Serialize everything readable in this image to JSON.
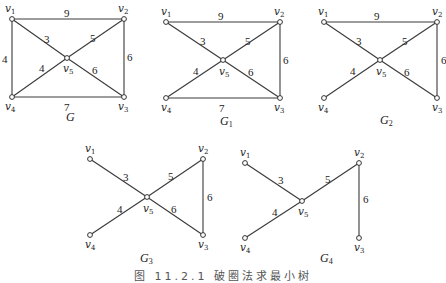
{
  "figure": {
    "caption": "图 11.2.1  破圈法求最小树",
    "colors": {
      "edge": "#3a3a3a",
      "node_fill": "#ffffff",
      "text": "#222222"
    },
    "graphs": [
      {
        "id": "G",
        "name": "G",
        "sub": "",
        "label_pos": [
          66,
          121
        ],
        "nodes": [
          {
            "id": "v1",
            "sub": "1",
            "x": 12,
            "y": 19,
            "lx": 5,
            "ly": 12
          },
          {
            "id": "v2",
            "sub": "2",
            "x": 124,
            "y": 19,
            "lx": 118,
            "ly": 12
          },
          {
            "id": "v3",
            "sub": "3",
            "x": 124,
            "y": 97,
            "lx": 118,
            "ly": 110
          },
          {
            "id": "v4",
            "sub": "4",
            "x": 12,
            "y": 97,
            "lx": 5,
            "ly": 110
          },
          {
            "id": "v5",
            "sub": "5",
            "x": 67,
            "y": 58,
            "lx": 63,
            "ly": 72
          }
        ],
        "edges": [
          {
            "from": "v1",
            "to": "v2",
            "w": "9",
            "lx": 64,
            "ly": 17
          },
          {
            "from": "v1",
            "to": "v5",
            "w": "3",
            "lx": 44,
            "ly": 43
          },
          {
            "from": "v2",
            "to": "v5",
            "w": "5",
            "lx": 90,
            "ly": 42
          },
          {
            "from": "v2",
            "to": "v3",
            "w": "6",
            "lx": 127,
            "ly": 61
          },
          {
            "from": "v1",
            "to": "v4",
            "w": "4",
            "lx": 2,
            "ly": 63
          },
          {
            "from": "v4",
            "to": "v5",
            "w": "4",
            "lx": 39,
            "ly": 72
          },
          {
            "from": "v5",
            "to": "v3",
            "w": "6",
            "lx": 92,
            "ly": 74
          },
          {
            "from": "v4",
            "to": "v3",
            "w": "7",
            "lx": 64,
            "ly": 111
          }
        ]
      },
      {
        "id": "G1",
        "name": "G",
        "sub": "1",
        "label_pos": [
          220,
          125
        ],
        "nodes": [
          {
            "id": "v1",
            "sub": "1",
            "x": 166,
            "y": 22,
            "lx": 161,
            "ly": 15
          },
          {
            "id": "v2",
            "sub": "2",
            "x": 280,
            "y": 22,
            "lx": 274,
            "ly": 15
          },
          {
            "id": "v3",
            "sub": "3",
            "x": 280,
            "y": 98,
            "lx": 274,
            "ly": 111
          },
          {
            "id": "v4",
            "sub": "4",
            "x": 166,
            "y": 98,
            "lx": 161,
            "ly": 111
          },
          {
            "id": "v5",
            "sub": "5",
            "x": 223,
            "y": 60,
            "lx": 219,
            "ly": 75
          }
        ],
        "edges": [
          {
            "from": "v1",
            "to": "v2",
            "w": "9",
            "lx": 218,
            "ly": 20
          },
          {
            "from": "v1",
            "to": "v5",
            "w": "3",
            "lx": 200,
            "ly": 45
          },
          {
            "from": "v2",
            "to": "v5",
            "w": "5",
            "lx": 245,
            "ly": 45
          },
          {
            "from": "v2",
            "to": "v3",
            "w": "6",
            "lx": 283,
            "ly": 64
          },
          {
            "from": "v4",
            "to": "v5",
            "w": "4",
            "lx": 193,
            "ly": 75
          },
          {
            "from": "v5",
            "to": "v3",
            "w": "6",
            "lx": 248,
            "ly": 76
          },
          {
            "from": "v4",
            "to": "v3",
            "w": "7",
            "lx": 219,
            "ly": 112
          }
        ]
      },
      {
        "id": "G2",
        "name": "G",
        "sub": "2",
        "label_pos": [
          380,
          124
        ],
        "nodes": [
          {
            "id": "v1",
            "sub": "1",
            "x": 324,
            "y": 22,
            "lx": 318,
            "ly": 15
          },
          {
            "id": "v2",
            "sub": "2",
            "x": 437,
            "y": 22,
            "lx": 432,
            "ly": 15
          },
          {
            "id": "v3",
            "sub": "3",
            "x": 437,
            "y": 98,
            "lx": 432,
            "ly": 111
          },
          {
            "id": "v4",
            "sub": "4",
            "x": 324,
            "y": 98,
            "lx": 318,
            "ly": 111
          },
          {
            "id": "v5",
            "sub": "5",
            "x": 380,
            "y": 60,
            "lx": 376,
            "ly": 75
          }
        ],
        "edges": [
          {
            "from": "v1",
            "to": "v2",
            "w": "9",
            "lx": 374,
            "ly": 20
          },
          {
            "from": "v1",
            "to": "v5",
            "w": "3",
            "lx": 356,
            "ly": 45
          },
          {
            "from": "v2",
            "to": "v5",
            "w": "5",
            "lx": 402,
            "ly": 45
          },
          {
            "from": "v2",
            "to": "v3",
            "w": "6",
            "lx": 441,
            "ly": 64
          },
          {
            "from": "v4",
            "to": "v5",
            "w": "4",
            "lx": 350,
            "ly": 75
          },
          {
            "from": "v5",
            "to": "v3",
            "w": "6",
            "lx": 404,
            "ly": 76
          }
        ]
      },
      {
        "id": "G3",
        "name": "G",
        "sub": "3",
        "label_pos": [
          140,
          262
        ],
        "nodes": [
          {
            "id": "v1",
            "sub": "1",
            "x": 90,
            "y": 159,
            "lx": 85,
            "ly": 152
          },
          {
            "id": "v2",
            "sub": "2",
            "x": 203,
            "y": 159,
            "lx": 198,
            "ly": 152
          },
          {
            "id": "v3",
            "sub": "3",
            "x": 203,
            "y": 235,
            "lx": 198,
            "ly": 248
          },
          {
            "id": "v4",
            "sub": "4",
            "x": 90,
            "y": 235,
            "lx": 85,
            "ly": 248
          },
          {
            "id": "v5",
            "sub": "5",
            "x": 147,
            "y": 197,
            "lx": 143,
            "ly": 212
          }
        ],
        "edges": [
          {
            "from": "v1",
            "to": "v5",
            "w": "3",
            "lx": 123,
            "ly": 181
          },
          {
            "from": "v2",
            "to": "v5",
            "w": "5",
            "lx": 168,
            "ly": 180
          },
          {
            "from": "v2",
            "to": "v3",
            "w": "6",
            "lx": 207,
            "ly": 201
          },
          {
            "from": "v4",
            "to": "v5",
            "w": "4",
            "lx": 117,
            "ly": 213
          },
          {
            "from": "v5",
            "to": "v3",
            "w": "6",
            "lx": 171,
            "ly": 213
          }
        ]
      },
      {
        "id": "G4",
        "name": "G",
        "sub": "4",
        "label_pos": [
          320,
          262
        ],
        "nodes": [
          {
            "id": "v1",
            "sub": "1",
            "x": 245,
            "y": 163,
            "lx": 240,
            "ly": 156
          },
          {
            "id": "v2",
            "sub": "2",
            "x": 359,
            "y": 163,
            "lx": 354,
            "ly": 156
          },
          {
            "id": "v3",
            "sub": "3",
            "x": 359,
            "y": 238,
            "lx": 354,
            "ly": 251
          },
          {
            "id": "v4",
            "sub": "4",
            "x": 245,
            "y": 238,
            "lx": 240,
            "ly": 251
          },
          {
            "id": "v5",
            "sub": "5",
            "x": 302,
            "y": 201,
            "lx": 298,
            "ly": 215
          }
        ],
        "edges": [
          {
            "from": "v1",
            "to": "v5",
            "w": "3",
            "lx": 278,
            "ly": 184
          },
          {
            "from": "v2",
            "to": "v5",
            "w": "5",
            "lx": 325,
            "ly": 183
          },
          {
            "from": "v2",
            "to": "v3",
            "w": "6",
            "lx": 363,
            "ly": 203
          },
          {
            "from": "v4",
            "to": "v5",
            "w": "4",
            "lx": 272,
            "ly": 216
          }
        ]
      }
    ]
  }
}
